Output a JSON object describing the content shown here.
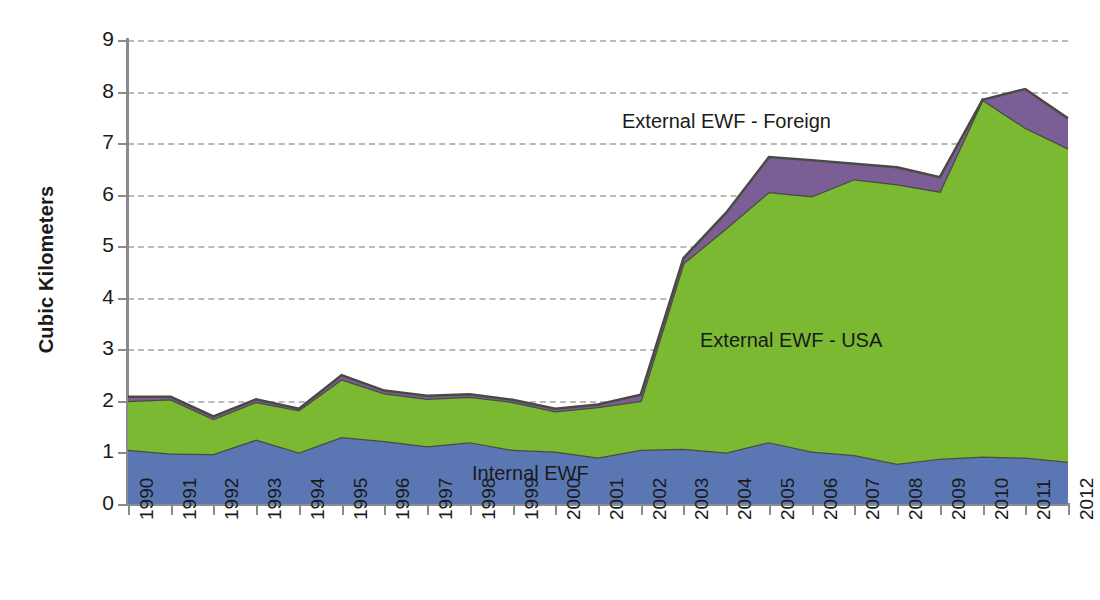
{
  "chart_data": {
    "type": "area",
    "stacked": true,
    "title": "",
    "xlabel": "",
    "ylabel": "Cubic Kilometers",
    "ylim": [
      0,
      9
    ],
    "ytick_labels": [
      "0",
      "1",
      "2",
      "3",
      "4",
      "5",
      "6",
      "7",
      "8",
      "9"
    ],
    "grid": "horizontal-dashed",
    "legend_position": "inline-annotations",
    "categories": [
      "1990",
      "1991",
      "1992",
      "1993",
      "1994",
      "1995",
      "1996",
      "1997",
      "1998",
      "1999",
      "2000",
      "2001",
      "2002",
      "2003",
      "2004",
      "2005",
      "2006",
      "2007",
      "2008",
      "2009",
      "2010",
      "2011",
      "2012"
    ],
    "series": [
      {
        "name": "Internal EWF",
        "color": "#5a77b4",
        "values": [
          1.05,
          0.98,
          0.97,
          1.25,
          1.0,
          1.3,
          1.22,
          1.12,
          1.2,
          1.05,
          1.02,
          0.9,
          1.05,
          1.07,
          1.0,
          1.2,
          1.02,
          0.95,
          0.78,
          0.88,
          0.92,
          0.9,
          0.82
        ]
      },
      {
        "name": "External EWF - USA",
        "color": "#7cb932",
        "values": [
          0.95,
          1.05,
          0.68,
          0.73,
          0.82,
          1.12,
          0.93,
          0.92,
          0.88,
          0.93,
          0.78,
          0.98,
          0.95,
          3.6,
          4.35,
          4.85,
          4.95,
          5.35,
          5.42,
          5.18,
          6.92,
          6.4,
          6.08
        ]
      },
      {
        "name": "External EWF - Foreign",
        "color": "#7b5e96",
        "values": [
          0.08,
          0.05,
          0.05,
          0.05,
          0.03,
          0.08,
          0.05,
          0.06,
          0.05,
          0.04,
          0.05,
          0.05,
          0.12,
          0.1,
          0.3,
          0.68,
          0.7,
          0.3,
          0.33,
          0.28,
          0.0,
          0.75,
          0.58
        ]
      }
    ],
    "totals": [
      2.08,
      2.08,
      1.7,
      2.03,
      1.85,
      2.5,
      2.2,
      2.1,
      2.13,
      2.02,
      1.85,
      1.93,
      2.12,
      4.77,
      5.65,
      6.73,
      6.67,
      6.6,
      6.53,
      6.34,
      7.84,
      8.05,
      7.48
    ]
  },
  "annotations": {
    "foreign": "External EWF - Foreign",
    "usa": "External EWF - USA",
    "internal": "Internal EWF"
  }
}
